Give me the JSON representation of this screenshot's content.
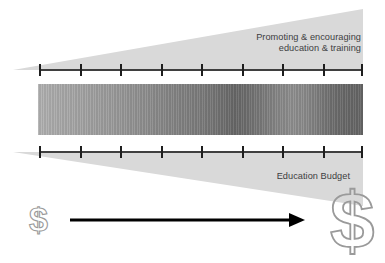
{
  "figure": {
    "type": "diagram",
    "kind": "funnel-timeline",
    "background_color": "#ffffff",
    "width": 385,
    "height": 263
  },
  "upper_band": {
    "caption": "Promoting & encouraging\neducation & training",
    "shape": "wedge-expanding-right",
    "fill_color": "#d9d9d9",
    "text_color": "#3d3d3f"
  },
  "lower_band": {
    "caption": "Education Budget",
    "shape": "wedge-expanding-right",
    "fill_color": "#d9d9d9",
    "text_color": "#3d3d3f"
  },
  "axes": {
    "tick_count": 9,
    "tick_color": "#1e1e1e",
    "line_color": "#3f3f3f",
    "tick_positions_pct": [
      0,
      12.5,
      25,
      37.5,
      50,
      62.5,
      75,
      87.5,
      100
    ]
  },
  "gradient_bar": {
    "description": "grayscale striated gradient band",
    "start_color": "#b0b0b0",
    "mid_color": "#676767",
    "end_color": "#656565",
    "stripe_style": "vertical-striations"
  },
  "arrow": {
    "direction": "right",
    "color": "#000000",
    "meaning": "time / growth"
  },
  "money": {
    "small_label": "$",
    "large_label": "$",
    "outline_color": "#9a9a9a"
  }
}
